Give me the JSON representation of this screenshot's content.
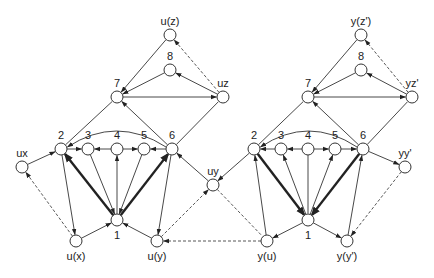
{
  "graphs": [
    {
      "name": "left",
      "nodes": [
        {
          "id": "uz_top",
          "label": "u(z)",
          "label_pos": "above"
        },
        {
          "id": "n8",
          "label": "8",
          "label_pos": "above"
        },
        {
          "id": "n7",
          "label": "7",
          "label_pos": "above"
        },
        {
          "id": "uz",
          "label": "uz",
          "label_pos": "above"
        },
        {
          "id": "n2",
          "label": "2",
          "label_pos": "above"
        },
        {
          "id": "n3",
          "label": "3",
          "label_pos": "above"
        },
        {
          "id": "n4",
          "label": "4",
          "label_pos": "above"
        },
        {
          "id": "n5",
          "label": "5",
          "label_pos": "above"
        },
        {
          "id": "n6",
          "label": "6",
          "label_pos": "above"
        },
        {
          "id": "ux",
          "label": "ux",
          "label_pos": "above"
        },
        {
          "id": "uy",
          "label": "uy",
          "label_pos": "above"
        },
        {
          "id": "n1",
          "label": "1",
          "label_pos": "below"
        },
        {
          "id": "ux_b",
          "label": "u(x)",
          "label_pos": "below"
        },
        {
          "id": "uy_b",
          "label": "u(y)",
          "label_pos": "below"
        }
      ],
      "edges": [
        {
          "from": "uz_top",
          "to": "n7",
          "style": "normal"
        },
        {
          "from": "n8",
          "to": "n7",
          "style": "normal"
        },
        {
          "from": "uz",
          "to": "n8",
          "style": "normal"
        },
        {
          "from": "n7",
          "to": "uz",
          "style": "normal"
        },
        {
          "from": "uz",
          "to": "uz_top",
          "style": "dashed"
        },
        {
          "from": "n2",
          "to": "n7",
          "style": "line"
        },
        {
          "from": "n6",
          "to": "n7",
          "style": "normal"
        },
        {
          "from": "n6",
          "to": "uz",
          "style": "line"
        },
        {
          "from": "n6",
          "to": "n2",
          "style": "curve"
        },
        {
          "from": "n2",
          "to": "n3",
          "style": "normal"
        },
        {
          "from": "n4",
          "to": "n3",
          "style": "normal"
        },
        {
          "from": "n4",
          "to": "n5",
          "style": "normal"
        },
        {
          "from": "n6",
          "to": "n5",
          "style": "normal"
        },
        {
          "from": "ux",
          "to": "n2",
          "style": "normal"
        },
        {
          "from": "uy",
          "to": "n6",
          "style": "normal"
        },
        {
          "from": "n1",
          "to": "n2",
          "style": "bold"
        },
        {
          "from": "n1",
          "to": "n6",
          "style": "bold"
        },
        {
          "from": "n1",
          "to": "n4",
          "style": "normal"
        },
        {
          "from": "n3",
          "to": "n1",
          "style": "normal"
        },
        {
          "from": "n5",
          "to": "n1",
          "style": "normal"
        },
        {
          "from": "n2",
          "to": "ux_b",
          "style": "normal"
        },
        {
          "from": "n6",
          "to": "uy_b",
          "style": "normal"
        },
        {
          "from": "ux_b",
          "to": "n1",
          "style": "normal"
        },
        {
          "from": "uy_b",
          "to": "n1",
          "style": "normal"
        },
        {
          "from": "ux_b",
          "to": "ux",
          "style": "dashed"
        },
        {
          "from": "uy_b",
          "to": "uy",
          "style": "dashed"
        }
      ]
    },
    {
      "name": "right",
      "nodes": [
        {
          "id": "yz_top",
          "label": "y(z')",
          "label_pos": "above"
        },
        {
          "id": "m8",
          "label": "8",
          "label_pos": "above"
        },
        {
          "id": "m7",
          "label": "7",
          "label_pos": "above"
        },
        {
          "id": "yz",
          "label": "yz'",
          "label_pos": "above"
        },
        {
          "id": "m2",
          "label": "2",
          "label_pos": "above"
        },
        {
          "id": "m3",
          "label": "3",
          "label_pos": "above"
        },
        {
          "id": "m4",
          "label": "4",
          "label_pos": "above"
        },
        {
          "id": "m5",
          "label": "5",
          "label_pos": "above"
        },
        {
          "id": "m6",
          "label": "6",
          "label_pos": "above"
        },
        {
          "id": "yy",
          "label": "yy'",
          "label_pos": "above"
        },
        {
          "id": "m1",
          "label": "1",
          "label_pos": "below"
        },
        {
          "id": "yu_b",
          "label": "y(u)",
          "label_pos": "below"
        },
        {
          "id": "yy_b",
          "label": "y(y')",
          "label_pos": "below"
        }
      ],
      "edges": [
        {
          "from": "yz_top",
          "to": "m7",
          "style": "normal"
        },
        {
          "from": "m8",
          "to": "m7",
          "style": "normal"
        },
        {
          "from": "yz",
          "to": "m8",
          "style": "normal"
        },
        {
          "from": "m7",
          "to": "yz",
          "style": "normal"
        },
        {
          "from": "yz",
          "to": "yz_top",
          "style": "dashed"
        },
        {
          "from": "m2",
          "to": "m7",
          "style": "line"
        },
        {
          "from": "m6",
          "to": "m7",
          "style": "normal"
        },
        {
          "from": "m6",
          "to": "yz",
          "style": "line"
        },
        {
          "from": "m6",
          "to": "m2",
          "style": "curve"
        },
        {
          "from": "m3",
          "to": "m2",
          "style": "normal"
        },
        {
          "from": "m4",
          "to": "m3",
          "style": "normal"
        },
        {
          "from": "m4",
          "to": "m5",
          "style": "normal"
        },
        {
          "from": "m5",
          "to": "m6",
          "style": "normal"
        },
        {
          "from": "m2",
          "to": "uy",
          "style": "normal"
        },
        {
          "from": "m6",
          "to": "yy",
          "style": "normal"
        },
        {
          "from": "m2",
          "to": "m1",
          "style": "bold"
        },
        {
          "from": "m6",
          "to": "m1",
          "style": "bold"
        },
        {
          "from": "m4",
          "to": "m1",
          "style": "line"
        },
        {
          "from": "m1",
          "to": "m3",
          "style": "normal"
        },
        {
          "from": "m1",
          "to": "m5",
          "style": "normal"
        },
        {
          "from": "yu_b",
          "to": "m2",
          "style": "normal"
        },
        {
          "from": "yy_b",
          "to": "m6",
          "style": "normal"
        },
        {
          "from": "m1",
          "to": "yu_b",
          "style": "normal"
        },
        {
          "from": "m1",
          "to": "yy_b",
          "style": "normal"
        },
        {
          "from": "uy",
          "to": "yu_b",
          "style": "dashed-line"
        },
        {
          "from": "yy",
          "to": "yy_b",
          "style": "dashed"
        },
        {
          "from": "yu_b",
          "to": "uy_b",
          "style": "dashed"
        }
      ]
    }
  ]
}
